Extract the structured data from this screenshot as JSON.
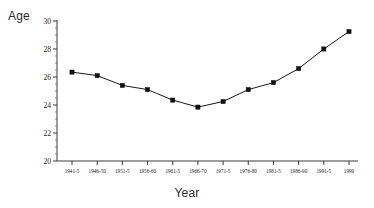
{
  "chart_data": {
    "type": "line",
    "title": "",
    "xlabel": "Year",
    "ylabel": "Age",
    "categories": [
      "1941-5",
      "1946-50",
      "1951-5",
      "1956-60",
      "1961-5",
      "1966-70",
      "1971-5",
      "1976-80",
      "1981-5",
      "1986-90",
      "1991-5",
      "1999"
    ],
    "values": [
      26.35,
      26.1,
      25.4,
      25.1,
      24.35,
      23.85,
      24.25,
      25.1,
      25.6,
      26.6,
      28.0,
      29.25
    ],
    "series": [
      {
        "name": "Age",
        "values": [
          26.35,
          26.1,
          25.4,
          25.1,
          24.35,
          23.85,
          24.25,
          25.1,
          25.6,
          26.6,
          28.0,
          29.25
        ]
      }
    ],
    "ylim": [
      20,
      30
    ],
    "ytick_labels": [
      "20",
      "22",
      "24",
      "26",
      "28",
      "30"
    ],
    "ytick_values": [
      20,
      22,
      24,
      26,
      28,
      30
    ],
    "yminor_step": 0.5,
    "grid": false,
    "legend": false,
    "legend_position": "none",
    "marker": "square",
    "line_color": "#1a1a1a",
    "marker_color": "#111111",
    "background_color": "#ffffff"
  },
  "labels": {
    "y_axis_title": "Age",
    "x_axis_title": "Year"
  }
}
